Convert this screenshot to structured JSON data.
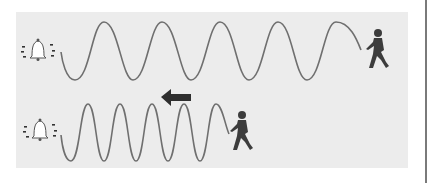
{
  "diagram": {
    "colors": {
      "background": "#ffffff",
      "panel": "#ececec",
      "wave": "#6f6f6f",
      "figure": "#3c3c3c",
      "divider": "#7a7a7a"
    },
    "rows": [
      {
        "id": "stationary",
        "source_icon": "bell-icon",
        "listener_icon": "walking-person-icon",
        "wave_cycles": 5.3,
        "motion_arrow": null,
        "description": "Listener at rest relative to waves: longer wavelength"
      },
      {
        "id": "moving-toward-source",
        "source_icon": "bell-icon",
        "listener_icon": "walking-person-icon",
        "wave_cycles": 6.5,
        "motion_arrow": "arrow-left-icon",
        "description": "Listener walks toward bell: compressed wavelength"
      }
    ]
  }
}
